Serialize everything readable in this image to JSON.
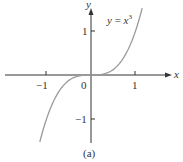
{
  "chart_data": {
    "type": "line",
    "title": "",
    "subtitle": "",
    "caption": "(a)",
    "xlabel": "x",
    "ylabel": "y",
    "xlim": [
      -1.9,
      1.8
    ],
    "ylim": [
      -1.55,
      1.55
    ],
    "x_ticks": [
      -1,
      1
    ],
    "x_tick_labels": [
      "−1",
      "1"
    ],
    "y_ticks": [
      1,
      -1
    ],
    "y_tick_labels": [
      "1",
      "−1"
    ],
    "origin_label": "0",
    "grid": false,
    "legend": null,
    "series": [
      {
        "name": "y = x^3",
        "function": "x^3",
        "color": "#9a9a9a",
        "x": [
          -1.15,
          -1.0,
          -0.8,
          -0.6,
          -0.4,
          -0.2,
          0.0,
          0.2,
          0.4,
          0.6,
          0.8,
          1.0,
          1.15
        ],
        "values": [
          -1.52,
          -1.0,
          -0.512,
          -0.216,
          -0.064,
          -0.008,
          0.0,
          0.008,
          0.064,
          0.216,
          0.512,
          1.0,
          1.52
        ]
      }
    ],
    "annotations": [
      {
        "text": "y = x³",
        "position": "upper right of y-axis"
      }
    ]
  },
  "labels": {
    "curve_label_y": "y",
    "curve_label_eq": " = ",
    "curve_label_x": "x",
    "curve_label_exp": "3",
    "x_axis_label": "x",
    "y_axis_label": "y",
    "x_tick_neg1": "−1",
    "x_tick_pos1": "1",
    "y_tick_pos1": "1",
    "y_tick_neg1": "−1",
    "origin": "0",
    "caption": "(a)"
  },
  "colors": {
    "axis": "#333333",
    "curve": "#9a9a9a",
    "text": "#333333"
  }
}
